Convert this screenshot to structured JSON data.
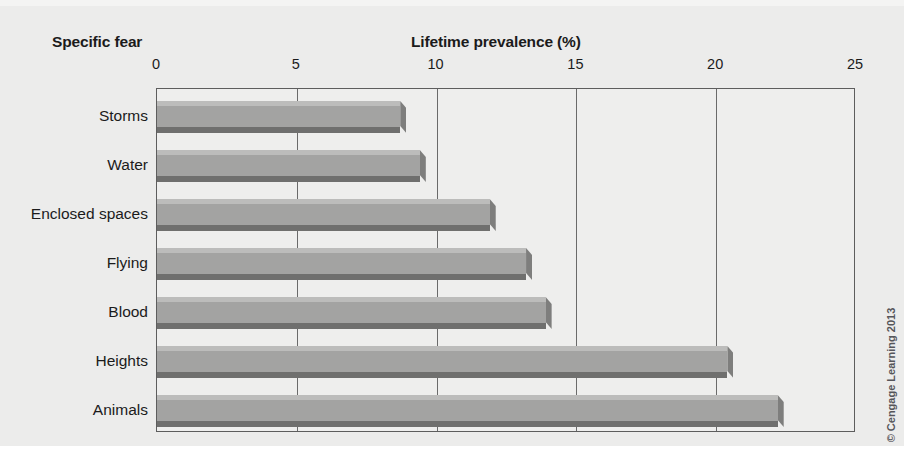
{
  "chart_data": {
    "type": "bar",
    "orientation": "horizontal",
    "title": "",
    "xlabel": "Lifetime prevalence (%)",
    "ylabel": "Specific fear",
    "categories": [
      "Storms",
      "Water",
      "Enclosed spaces",
      "Flying",
      "Blood",
      "Heights",
      "Animals"
    ],
    "values": [
      8.7,
      9.4,
      11.9,
      13.2,
      13.9,
      20.4,
      22.2
    ],
    "xlim": [
      0,
      25
    ],
    "xticks": [
      0,
      5,
      10,
      15,
      20,
      25
    ],
    "xtick_labels": [
      "0",
      "5",
      "10",
      "15",
      "20",
      "25"
    ],
    "grid": "vertical",
    "legend": "none",
    "bar_color": "#a3a3a2",
    "bar_highlight_color": "#bcbcbb",
    "bar_shadow_color": "#6f6f6e",
    "axis_color": "#5d5d5d",
    "plot_background": "#eeeeed",
    "figure_background": "#ececeb"
  },
  "credit": {
    "text": "© Cengage Learning 2013"
  }
}
